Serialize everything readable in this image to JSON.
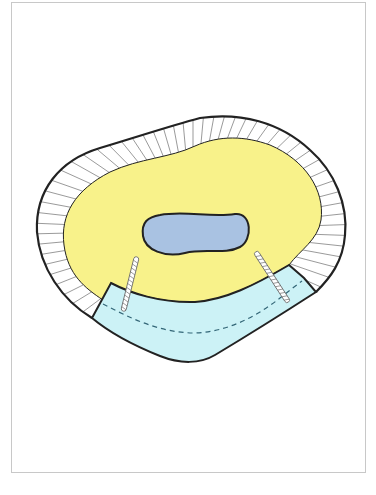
{
  "figure": {
    "type": "anatomical-cross-section",
    "regions": [
      {
        "name": "outer-cortex-ring",
        "fill": "#ffffff",
        "stroke": "#222222",
        "pattern": "radial-hatching"
      },
      {
        "name": "inner-medullary-region",
        "fill": "#f8f28a"
      },
      {
        "name": "central-canal",
        "fill": "#a9c2e2",
        "stroke": "#222222"
      },
      {
        "name": "curved-plate-graft",
        "fill": "#ccf2f6",
        "stroke": "#222222",
        "detail": "dashed-centerline"
      },
      {
        "name": "left-screw",
        "fill": "#ffffff",
        "stroke": "#666666"
      },
      {
        "name": "right-screw",
        "fill": "#ffffff",
        "stroke": "#666666"
      }
    ],
    "colors": {
      "outline": "#222222",
      "yellow": "#f8f28a",
      "canal_blue": "#a9c2e2",
      "plate_blue": "#ccf2f6",
      "frame": "#c8c8c8"
    }
  }
}
